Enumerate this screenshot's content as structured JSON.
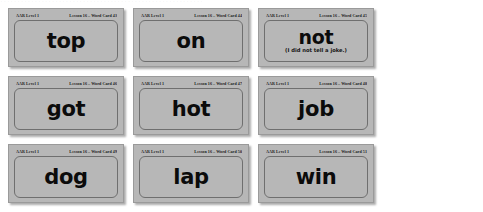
{
  "page": {
    "top_bleed_text": "..........................................................."
  },
  "cards": [
    {
      "header_left": "AAR Level 1",
      "header_right": "Lesson 16 – Word Card 43",
      "word": "top",
      "subtitle": ""
    },
    {
      "header_left": "AAR Level 1",
      "header_right": "Lesson 16 – Word Card 44",
      "word": "on",
      "subtitle": ""
    },
    {
      "header_left": "AAR Level 1",
      "header_right": "Lesson 16 – Word Card 45",
      "word": "not",
      "subtitle": "(I did not tell a joke.)"
    },
    {
      "header_left": "AAR Level 1",
      "header_right": "Lesson 16 – Word Card 46",
      "word": "got",
      "subtitle": ""
    },
    {
      "header_left": "AAR Level 1",
      "header_right": "Lesson 16 – Word Card 47",
      "word": "hot",
      "subtitle": ""
    },
    {
      "header_left": "AAR Level 1",
      "header_right": "Lesson 16 – Word Card 48",
      "word": "job",
      "subtitle": ""
    },
    {
      "header_left": "AAR Level 1",
      "header_right": "Lesson 16 – Word Card 49",
      "word": "dog",
      "subtitle": ""
    },
    {
      "header_left": "AAR Level 1",
      "header_right": "Lesson 16 – Word Card 50",
      "word": "lap",
      "subtitle": ""
    },
    {
      "header_left": "AAR Level 1",
      "header_right": "Lesson 16 – Word Card 51",
      "word": "win",
      "subtitle": ""
    }
  ],
  "colors": {
    "card_background": "#b7b7b7",
    "card_border": "#9a9a9a",
    "inner_border": "#6f6f6f",
    "word_text": "#0b0b0b",
    "page_background": "#ffffff"
  }
}
